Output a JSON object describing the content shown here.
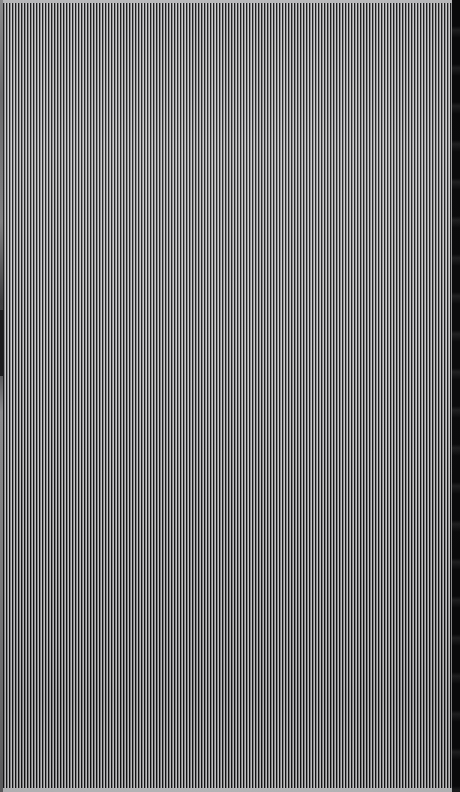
{
  "canvas": {
    "width": 460,
    "height": 792,
    "description": "Full-bleed dense vertical stripe pattern with no legible interface text",
    "background_color": "#9a9a9a"
  },
  "pattern": {
    "type": "vertical-stripes",
    "orientation": "vertical",
    "period_px": 3,
    "dark_color": "#111112",
    "light_color": "#e4e4e6",
    "mid_color": "#9a9a9c",
    "coverage": "full-canvas",
    "beat_period_px": 34,
    "notes": "aliased moire field, period approximately three pixels"
  },
  "edges": {
    "top_band": {
      "label": "top light band",
      "color": "#b9b9bb",
      "height_px": 3
    },
    "bottom_band": {
      "label": "bottom light band",
      "color": "#b9b9bb",
      "height_px": 4
    },
    "left_gutter": {
      "label": "left gray rail",
      "color": "#6a6a6c",
      "width_px": 3
    },
    "left_gutter_notch": {
      "label": "dark notch segment",
      "color": "#1b1b1d",
      "top_px": 310,
      "height_px": 66
    },
    "right_edge": {
      "label": "right black band",
      "color": "#09090a",
      "width_px": 8
    }
  },
  "accessibility": {
    "caption": "Screenshot consisting entirely of fine vertical black and white stripes; no user interface elements, text, or controls are discernible."
  }
}
